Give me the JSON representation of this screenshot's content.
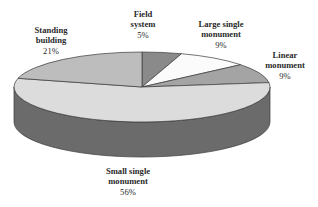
{
  "chart_data": {
    "type": "pie",
    "style": "3d",
    "title": "",
    "start_angle_deg": 90,
    "direction": "clockwise",
    "geometry": {
      "cx": 142,
      "cy": 87,
      "rx": 128,
      "ry": 35,
      "depth": 35
    },
    "side_color": "#6b6b6b",
    "slices": [
      {
        "label": "Field system",
        "value": 5,
        "pct_label": "5%",
        "color": "#8a8a8a",
        "label_pos": {
          "x": 143,
          "y": 9
        },
        "lines": [
          "Field",
          "system"
        ]
      },
      {
        "label": "Large single monument",
        "value": 9,
        "pct_label": "9%",
        "color": "#fbfbfb",
        "label_pos": {
          "x": 221,
          "y": 19
        },
        "lines": [
          "Large single",
          "monument"
        ]
      },
      {
        "label": "Linear monument",
        "value": 9,
        "pct_label": "9%",
        "color": "#a4a4a4",
        "label_pos": {
          "x": 285,
          "y": 50
        },
        "lines": [
          "Linear",
          "monument"
        ]
      },
      {
        "label": "Small single monument",
        "value": 56,
        "pct_label": "56%",
        "color": "#dcdcdc",
        "label_pos": {
          "x": 128,
          "y": 166
        },
        "lines": [
          "Small single",
          "monument"
        ]
      },
      {
        "label": "Standing building",
        "value": 21,
        "pct_label": "21%",
        "color": "#bdbdbd",
        "label_pos": {
          "x": 51,
          "y": 25
        },
        "lines": [
          "Standing",
          "building"
        ]
      }
    ]
  }
}
